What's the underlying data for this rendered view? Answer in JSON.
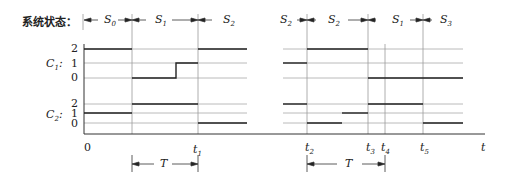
{
  "title": "系统状态：",
  "states_top": {
    "left": [
      "S0",
      "S1",
      "S2"
    ],
    "right": [
      "S2",
      "S2",
      "S1",
      "S3"
    ]
  },
  "signals": [
    {
      "name": "C",
      "sub": "1",
      "ticks": [
        "2",
        "1",
        "0"
      ]
    },
    {
      "name": "C",
      "sub": "2",
      "ticks": [
        "2",
        "1",
        "0"
      ]
    }
  ],
  "x_axis": {
    "origin_label": "0",
    "end_label": "t",
    "time_marks": [
      {
        "name": "t",
        "sub": "1"
      },
      {
        "name": "t",
        "sub": "2"
      },
      {
        "name": "t",
        "sub": "3"
      },
      {
        "name": "t",
        "sub": "4"
      },
      {
        "name": "t",
        "sub": "5"
      }
    ]
  },
  "period_label": "T",
  "waveforms": {
    "C1_left": [
      [
        0,
        2
      ],
      [
        1,
        0
      ],
      [
        1.5,
        1
      ],
      [
        2,
        2
      ]
    ],
    "C2_left": [
      [
        0,
        1
      ],
      [
        1,
        2
      ],
      [
        2,
        0
      ]
    ],
    "C1_right": [
      [
        "start",
        1
      ],
      [
        "t2",
        2
      ],
      [
        "t3",
        0
      ]
    ],
    "C2_right": [
      [
        "start",
        2
      ],
      [
        "t2",
        0
      ],
      [
        "mid",
        1
      ],
      [
        "t3",
        2
      ],
      [
        "t5",
        0
      ]
    ]
  },
  "colors": {
    "line": "#222222",
    "grid": "#9a9a9a"
  }
}
